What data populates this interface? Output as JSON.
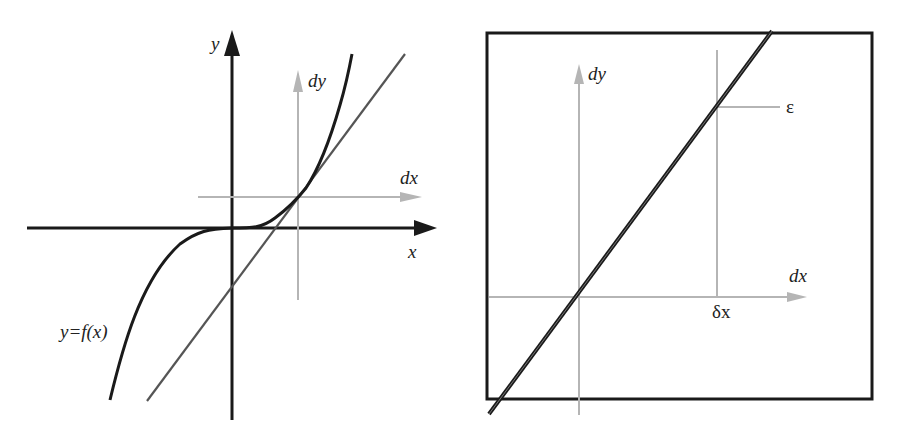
{
  "left_panel": {
    "labels": {
      "y_axis": "y",
      "x_axis": "x",
      "dy": "dy",
      "dx": "dx",
      "curve": "y=f(x)"
    },
    "description": "Cubic-like curve y=f(x) with tangent line at a point; local dx/dy axes at tangency point"
  },
  "right_panel": {
    "labels": {
      "dy": "dy",
      "dx": "dx",
      "epsilon": "ε",
      "delta_x": "δx"
    },
    "description": "Zoomed view: curve appears as a straight line in local dx/dy coordinates; ε deviation at δx"
  },
  "colors": {
    "axis": "#1a1a1a",
    "curve": "#1a1a1a",
    "tangent": "#555555",
    "local_axes": "#b0b0b0",
    "frame": "#1a1a1a"
  }
}
